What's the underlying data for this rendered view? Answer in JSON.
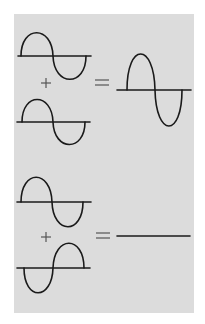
{
  "diagram": {
    "colors": {
      "background": "#ffffff",
      "panel": "#dcdcdc",
      "stroke": "#1a1a1a",
      "symbol": "#555555"
    },
    "rows": [
      {
        "name": "constructive-interference",
        "wave_a": {
          "phase": "in-phase",
          "axis_y": 56,
          "amplitude": 24
        },
        "operator": "+",
        "wave_b": {
          "phase": "in-phase",
          "axis_y": 122,
          "amplitude": 23
        },
        "equals": "=",
        "result": {
          "type": "double-amplitude sine",
          "axis_y": 90,
          "amplitude": 37
        }
      },
      {
        "name": "destructive-interference",
        "wave_a": {
          "phase": "in-phase",
          "axis_y": 202,
          "amplitude": 25
        },
        "operator": "+",
        "wave_b": {
          "phase": "inverted",
          "axis_y": 268,
          "amplitude": 25
        },
        "equals": "=",
        "result": {
          "type": "flat line",
          "axis_y": 236,
          "amplitude": 0
        }
      }
    ]
  }
}
